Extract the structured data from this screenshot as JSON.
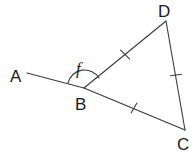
{
  "figure": {
    "kind": "geometry-diagram",
    "background_color": "#ffffff",
    "stroke_color": "#3a3a3a",
    "label_color": "#1a1a1a",
    "stroke_width": 1.1,
    "width": 196,
    "height": 154
  },
  "points": [
    {
      "name": "A",
      "label": "A",
      "x": 27,
      "y": 73,
      "label_x": 10,
      "label_y": 82
    },
    {
      "name": "B",
      "label": "B",
      "x": 84,
      "y": 88,
      "label_x": 75,
      "label_y": 110
    },
    {
      "name": "C",
      "label": "C",
      "x": 185,
      "y": 130,
      "label_x": 177,
      "label_y": 150
    },
    {
      "name": "D",
      "label": "D",
      "x": 166,
      "y": 21,
      "label_x": 158,
      "label_y": 17
    }
  ],
  "segments": [
    {
      "name": "segment-AB",
      "from": "A",
      "to": "B",
      "ticks": 0
    },
    {
      "name": "segment-BD",
      "from": "B",
      "to": "D",
      "ticks": 1
    },
    {
      "name": "segment-BC",
      "from": "B",
      "to": "C",
      "ticks": 1
    },
    {
      "name": "segment-DC",
      "from": "D",
      "to": "C",
      "ticks": 1
    }
  ],
  "tick_marks": [
    {
      "name": "tick-BD",
      "on": "segment-BD",
      "x": 125,
      "y": 54.5
    },
    {
      "name": "tick-BC",
      "on": "segment-BC",
      "x": 134,
      "y": 108
    },
    {
      "name": "tick-DC",
      "on": "segment-DC",
      "x": 176,
      "y": 75
    }
  ],
  "angles": [
    {
      "name": "angle-f",
      "label": "f",
      "vertex": "B",
      "between": [
        "A",
        "D"
      ],
      "arc_path": "M 68 83 A 17 17 0 0 1 99 78",
      "label_x": 76,
      "label_y": 74
    }
  ]
}
